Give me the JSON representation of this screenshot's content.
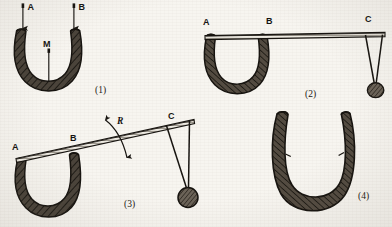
{
  "figure": {
    "caption_style": "numbered-parenthesis",
    "ink_color": "#16130f",
    "paper_color": "#f7f5f0",
    "magnet_fill": "#4a433a",
    "panels": [
      {
        "number": "(1)",
        "description": "Horseshoe magnet with poles A and B and keeper M",
        "labels": [
          {
            "text": "A",
            "role": "pole-label"
          },
          {
            "text": "B",
            "role": "pole-label"
          },
          {
            "text": "M",
            "role": "keeper-label"
          }
        ]
      },
      {
        "number": "(2)",
        "description": "Horseshoe magnet with bar across poles A and B, weight hung at C",
        "labels": [
          {
            "text": "A",
            "role": "pole-label"
          },
          {
            "text": "B",
            "role": "pole-label"
          },
          {
            "text": "C",
            "role": "load-point-label"
          }
        ]
      },
      {
        "number": "(3)",
        "description": "Bar tilted about the magnet, rotation R indicated, weight at C",
        "labels": [
          {
            "text": "A",
            "role": "pole-label"
          },
          {
            "text": "B",
            "role": "pole-label"
          },
          {
            "text": "C",
            "role": "load-point-label"
          },
          {
            "text": "R",
            "role": "rotation-label"
          }
        ]
      },
      {
        "number": "(4)",
        "description": "Horseshoe magnet alone with splayed arms",
        "labels": []
      }
    ]
  }
}
